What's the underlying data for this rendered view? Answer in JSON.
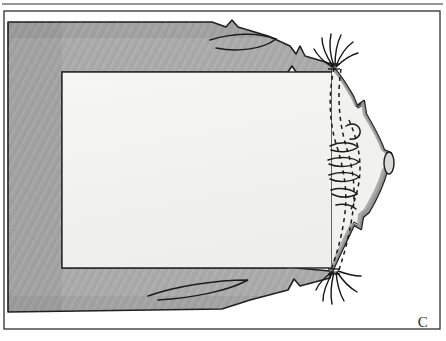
{
  "figure": {
    "panel_label": "C",
    "medium": "pencil-shaded ink line drawing",
    "border": {
      "outer_frame_color": "#2e2e2e",
      "outer_frame_width_px": 1,
      "inner_frame_color": "#3a3a3a",
      "inner_frame_width_px": 1,
      "background_color": "#ffffff"
    },
    "regions": [
      {
        "name": "shaded-band",
        "description": "U-shaped graphite-shaded band forming the left, top and bottom margins of the specimen",
        "fill_color": "#ababab",
        "outline_color": "#1f1f1f",
        "texture": "fine diagonal pencil hatching"
      },
      {
        "name": "inner-cavity",
        "description": "Large pale rectangular interior cavity",
        "fill_color": "#f4f4f2",
        "outline_color": "#2a2a2a"
      },
      {
        "name": "lobed-margin",
        "description": "Right-hand scalloped and lobed margin with internal branching folds",
        "fill_color": "#bdbdbd",
        "outline_color": "#1a1a1a"
      },
      {
        "name": "dashed-tracts",
        "description": "Paired dashed guide lines tracing the inner course of the lobed margin",
        "stroke_color": "#1a1a1a",
        "dash_pattern": "4 4"
      },
      {
        "name": "bristle-tufts",
        "description": "Two tufts of fine hair-like bristles at the upper and lower junctions of the band and lobed margin",
        "stroke_color": "#161616",
        "count": 2
      },
      {
        "name": "edge-notch",
        "description": "Small V-shaped notches interrupting the shaded band edge",
        "count": 4
      },
      {
        "name": "marginal-nodule",
        "description": "Small pale oval nodule on the outermost point of the lobed margin",
        "fill_color": "#d8d8d4"
      }
    ],
    "colors": {
      "graphite_gray": "#ababab",
      "graphite_gray_dark": "#8e8e8e",
      "cavity_white": "#f4f4f2",
      "ink_black": "#1a1a1a",
      "frame_gray": "#2e2e2e",
      "label_gray": "#2b2b2b"
    }
  }
}
